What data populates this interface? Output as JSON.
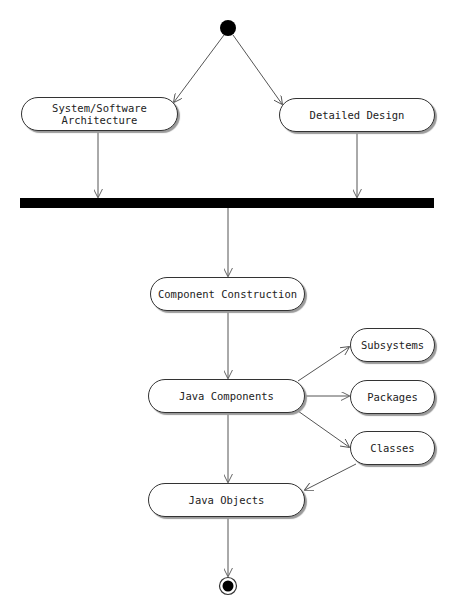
{
  "diagram": {
    "type": "uml-activity",
    "start": {
      "label": ""
    },
    "nodes": {
      "system_software_architecture": "System/Software\nArchitecture",
      "detailed_design": "Detailed Design",
      "component_construction": "Component Construction",
      "java_components": "Java Components",
      "subsystems": "Subsystems",
      "packages": "Packages",
      "classes": "Classes",
      "java_objects": "Java Objects"
    },
    "edges": [
      {
        "from": "start",
        "to": "System/Software Architecture"
      },
      {
        "from": "start",
        "to": "Detailed Design"
      },
      {
        "from": "System/Software Architecture",
        "to": "sync-bar"
      },
      {
        "from": "Detailed Design",
        "to": "sync-bar"
      },
      {
        "from": "sync-bar",
        "to": "Component Construction"
      },
      {
        "from": "Component Construction",
        "to": "Java Components"
      },
      {
        "from": "Java Components",
        "to": "Subsystems"
      },
      {
        "from": "Java Components",
        "to": "Packages"
      },
      {
        "from": "Java Components",
        "to": "Classes"
      },
      {
        "from": "Java Components",
        "to": "Java Objects"
      },
      {
        "from": "Classes",
        "to": "Java Objects"
      },
      {
        "from": "Java Objects",
        "to": "end"
      }
    ],
    "colors": {
      "line": "#555555",
      "fill": "#000000",
      "node_border": "#333333"
    }
  }
}
